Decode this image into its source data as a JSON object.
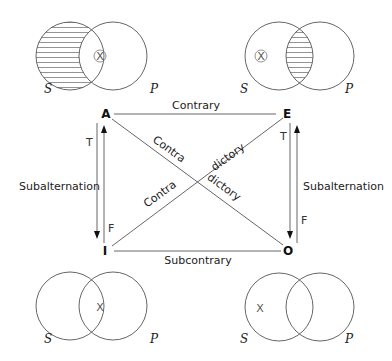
{
  "diagram": {
    "corners": {
      "A": "A",
      "E": "E",
      "I": "I",
      "O": "O"
    },
    "relations": {
      "top": "Contrary",
      "bottom": "Subcontrary",
      "left": "Subalternation",
      "right": "Subalternation",
      "diag1_a": "Contra",
      "diag1_b": "dictory",
      "diag2_a": "Contra",
      "diag2_b": "dictory"
    },
    "truth_labels": {
      "left_top": "T",
      "left_bottom": "F",
      "right_top": "T",
      "right_bottom": "F"
    },
    "venn": {
      "top_left": {
        "s": "S",
        "p": "P",
        "mark": "X",
        "mark_circled": true,
        "shaded": "S-only"
      },
      "top_right": {
        "s": "S",
        "p": "P",
        "mark": "X",
        "mark_circled": true,
        "shaded": "intersection"
      },
      "bottom_left": {
        "s": "S",
        "p": "P",
        "mark": "X",
        "mark_circled": false,
        "shaded": "none"
      },
      "bottom_right": {
        "s": "S",
        "p": "P",
        "mark": "X",
        "mark_circled": false,
        "shaded": "none"
      }
    },
    "colors": {
      "line": "#555555",
      "text": "#222222",
      "hatch": "#777777"
    }
  }
}
